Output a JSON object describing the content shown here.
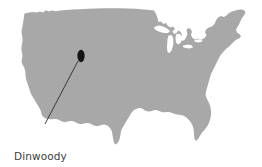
{
  "figure": {
    "type": "reference-map",
    "background_color": "#ffffff",
    "width": 262,
    "height": 167
  },
  "map": {
    "landmass_name": "united-states-silhouette",
    "land_color": "#a8a8a8",
    "lake_color": "#ffffff",
    "lakes": [
      "Lake Superior",
      "Lake Michigan",
      "Lake Huron",
      "Lake Erie",
      "Lake Ontario"
    ]
  },
  "annotation": {
    "label_line_1": "Dinwoody",
    "label_line_2": "tradition",
    "full_label": "Dinwoody tradition",
    "text_color": "#3c3c3c",
    "marker": {
      "name": "dinwoody-site-marker",
      "shape": "ellipse",
      "color": "#141414",
      "center_x": 81,
      "center_y": 56,
      "radius_x": 3.6,
      "radius_y": 6.2
    },
    "leader": {
      "color": "#2b2b2b",
      "from_x": 78,
      "from_y": 61,
      "to_x": 45,
      "to_y": 124,
      "width": 0.9
    }
  },
  "chart_data": {
    "type": "map",
    "title": "Dinwoody tradition",
    "region": "Contiguous United States",
    "annotations": [
      {
        "label": "Dinwoody tradition",
        "marker_type": "filled-ellipse",
        "x": 81,
        "y": 56,
        "approx_location": "northwestern Wyoming / Wind River Basin"
      }
    ],
    "legend": [],
    "grid": false
  }
}
